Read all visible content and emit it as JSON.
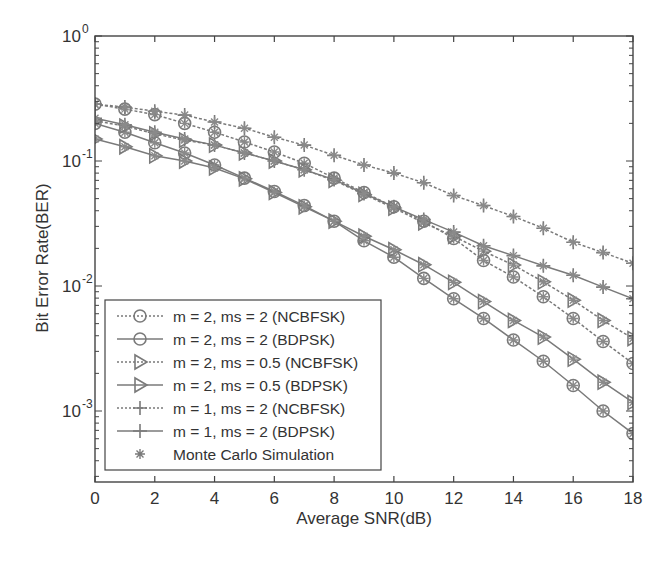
{
  "chart_data": {
    "type": "line",
    "title": "",
    "xlabel": "Average SNR(dB)",
    "ylabel": "Bit Error Rate(BER)",
    "xlim": [
      0,
      18
    ],
    "ylim": [
      0.00027,
      1
    ],
    "yscale": "log",
    "grid": false,
    "legend_position": "lower left",
    "x_ticks": [
      0,
      2,
      4,
      6,
      8,
      10,
      12,
      14,
      16,
      18
    ],
    "y_ticks": [
      {
        "value": 1,
        "label": "10",
        "exp": "0"
      },
      {
        "value": 0.1,
        "label": "10",
        "exp": "-1"
      },
      {
        "value": 0.01,
        "label": "10",
        "exp": "-2"
      },
      {
        "value": 0.001,
        "label": "10",
        "exp": "-3"
      }
    ],
    "x": [
      0,
      1,
      2,
      3,
      4,
      5,
      6,
      7,
      8,
      9,
      10,
      11,
      12,
      13,
      14,
      15,
      16,
      17,
      18
    ],
    "series": [
      {
        "name": "m = 2, ms = 2 (NCBFSK)",
        "line": "dotted",
        "marker": "circle",
        "values": [
          0.285,
          0.26,
          0.235,
          0.2,
          0.17,
          0.142,
          0.118,
          0.096,
          0.073,
          0.056,
          0.043,
          0.033,
          0.024,
          0.016,
          0.0118,
          0.0082,
          0.0055,
          0.0036,
          0.0024
        ]
      },
      {
        "name": "m = 2, ms = 2 (BDPSK)",
        "line": "solid",
        "marker": "circle",
        "values": [
          0.2,
          0.17,
          0.14,
          0.116,
          0.093,
          0.073,
          0.057,
          0.044,
          0.033,
          0.023,
          0.017,
          0.0115,
          0.0079,
          0.0055,
          0.0037,
          0.0025,
          0.0016,
          0.001,
          0.00066
        ]
      },
      {
        "name": "m = 2, ms = 0.5 (NCBFSK)",
        "line": "dotted",
        "marker": "triangle",
        "values": [
          0.21,
          0.19,
          0.165,
          0.147,
          0.134,
          0.116,
          0.1,
          0.085,
          0.07,
          0.054,
          0.042,
          0.032,
          0.025,
          0.019,
          0.0147,
          0.0108,
          0.0077,
          0.0053,
          0.0038
        ]
      },
      {
        "name": "m = 2, ms = 0.5 (BDPSK)",
        "line": "solid",
        "marker": "triangle",
        "values": [
          0.15,
          0.13,
          0.11,
          0.1,
          0.088,
          0.072,
          0.056,
          0.043,
          0.033,
          0.025,
          0.0195,
          0.0148,
          0.0107,
          0.0075,
          0.0053,
          0.0039,
          0.0026,
          0.0017,
          0.00117
        ]
      },
      {
        "name": "m = 1, ms = 2 (NCBFSK)",
        "line": "dotted",
        "marker": "plus",
        "values": [
          0.285,
          0.27,
          0.25,
          0.233,
          0.205,
          0.183,
          0.155,
          0.134,
          0.111,
          0.093,
          0.08,
          0.067,
          0.053,
          0.044,
          0.036,
          0.029,
          0.0224,
          0.0185,
          0.0152
        ]
      },
      {
        "name": "m = 1, ms = 2 (BDPSK)",
        "line": "solid",
        "marker": "plus",
        "values": [
          0.22,
          0.195,
          0.17,
          0.15,
          0.134,
          0.116,
          0.1,
          0.085,
          0.071,
          0.055,
          0.043,
          0.034,
          0.027,
          0.021,
          0.0175,
          0.0145,
          0.0122,
          0.0098,
          0.0079
        ]
      },
      {
        "name": "Monte Carlo Simulation",
        "line": "none",
        "marker": "star",
        "values": null
      }
    ]
  },
  "colors": {
    "line": "#7a7a7a",
    "axis": "#444444",
    "text": "#333333",
    "background": "#ffffff"
  }
}
